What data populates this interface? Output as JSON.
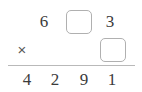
{
  "problem": {
    "type": "vertical-multiplication",
    "operator_symbol": "×",
    "rows": {
      "multiplicand": {
        "cells": [
          {
            "kind": "digit",
            "value": "6"
          },
          {
            "kind": "input",
            "value": ""
          },
          {
            "kind": "digit",
            "value": "3"
          }
        ]
      },
      "multiplier": {
        "operator": "×",
        "cells": [
          {
            "kind": "input",
            "value": ""
          }
        ]
      },
      "product": {
        "cells": [
          {
            "kind": "digit",
            "value": "4"
          },
          {
            "kind": "digit",
            "value": "2"
          },
          {
            "kind": "digit",
            "value": "9"
          },
          {
            "kind": "digit",
            "value": "1"
          }
        ]
      }
    },
    "colors": {
      "digit": "#3b3b3b",
      "operator": "#5a5a5a",
      "box_border": "#b0b0b0",
      "rule": "#b9b9b9",
      "background": "#ffffff"
    }
  }
}
